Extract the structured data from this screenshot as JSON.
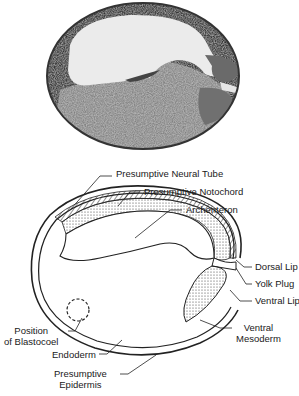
{
  "photo": {
    "description": "Micrograph section of amphibian gastrula",
    "colors": {
      "background": "#ffffff",
      "tissue_dark": "#3a3a3a",
      "tissue_mid": "#8a8a8a",
      "cavity": "#e9e9e9"
    }
  },
  "diagram": {
    "labels": {
      "neural_tube": "Presumptive Neural Tube",
      "notochord": "Presumptive Notochord",
      "archenteron": "Archenteron",
      "dorsal_lip": "Dorsal Lip",
      "yolk_plug": "Yolk Plug",
      "ventral_lip": "Ventral Lip",
      "ventral_mesoderm_1": "Ventral",
      "ventral_mesoderm_2": "Mesoderm",
      "blastocoel_1": "Position",
      "blastocoel_2": "of Blastocoel",
      "endoderm": "Endoderm",
      "epidermis_1": "Presumptive",
      "epidermis_2": "Epidermis"
    }
  }
}
